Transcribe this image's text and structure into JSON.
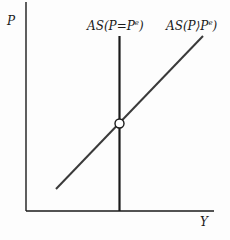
{
  "diagram": {
    "axes": {
      "y_label": "P",
      "x_label": "Y"
    },
    "curves": [
      {
        "id": "vertical",
        "label": "AS(P=Pᵉ)",
        "label_main": "AS(P=P",
        "label_sup": "e",
        "label_close": ")"
      },
      {
        "id": "upward",
        "label": "AS(P>Pᵉ)",
        "label_main": "AS(P⟩P",
        "label_sup": "e",
        "label_close": ")"
      }
    ],
    "intersection": {
      "marker": "open-circle"
    },
    "colors": {
      "line": "#1a1a1a",
      "upward_line": "#3a3a3a",
      "background": "#fdfdfd"
    }
  }
}
